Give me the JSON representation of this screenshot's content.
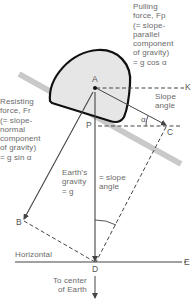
{
  "diagram": {
    "points": {
      "A": "A",
      "B": "B",
      "C": "C",
      "D": "D",
      "E": "E",
      "K": "K",
      "P": "P",
      "alpha": "α"
    },
    "labels": {
      "pulling_force": "Pulling\nforce, Fp\n(= slope-\nparallel\ncomponent\nof gravity)\n= g cos α",
      "slope_angle": "Slope\nangle",
      "resisting_force": "Resisting\nforce, Fr\n(= slope-\nnormal\ncomponent\nof gravity)\n= g sin α",
      "earth_gravity": "Earth's\ngravity\n= g",
      "equals_slope_angle": "= slope\nangle",
      "horizontal": "Horizontal",
      "to_center": "To center\nof Earth"
    },
    "colors": {
      "rock_fill": "#e8e8e8",
      "rock_outline": "#111111",
      "slope_bar": "#c8c8c8",
      "lines": "#444444",
      "text": "#6a6a6a"
    }
  }
}
